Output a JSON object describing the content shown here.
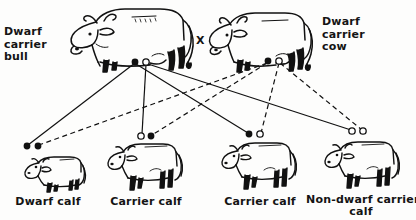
{
  "figure": {
    "ink_color": "#111111",
    "background_color": "#fdfdfc",
    "cross_symbol": "X"
  },
  "parents": [
    {
      "id": "bull",
      "label": "Dwarf\ncarrier\nbull",
      "label_lines": [
        "Dwarf",
        "carrier",
        "bull"
      ],
      "animal": "adult-bull",
      "gametes": [
        {
          "type": "filled",
          "allele": "dwarf",
          "x": 135,
          "y": 62
        },
        {
          "type": "open",
          "allele": "normal",
          "x": 146,
          "y": 62
        }
      ]
    },
    {
      "id": "cow",
      "label": "Dwarf\ncarrier\ncow",
      "label_lines": [
        "Dwarf",
        "carrier",
        "cow"
      ],
      "animal": "adult-cow",
      "gametes": [
        {
          "type": "filled",
          "allele": "dwarf",
          "x": 268,
          "y": 61
        },
        {
          "type": "open",
          "allele": "normal",
          "x": 279,
          "y": 61
        }
      ]
    }
  ],
  "offspring": [
    {
      "id": "calf-1",
      "label": "Dwarf calf",
      "label_lines": [
        "Dwarf calf"
      ],
      "animal": "dwarf-calf",
      "genotype": [
        {
          "type": "filled",
          "allele": "dwarf",
          "x": 27,
          "y": 146
        },
        {
          "type": "filled",
          "allele": "dwarf",
          "x": 38,
          "y": 146
        }
      ]
    },
    {
      "id": "calf-2",
      "label": "Carrier calf",
      "label_lines": [
        "Carrier calf"
      ],
      "animal": "normal-calf",
      "genotype": [
        {
          "type": "open",
          "allele": "normal",
          "x": 141,
          "y": 136
        },
        {
          "type": "filled",
          "allele": "dwarf",
          "x": 151,
          "y": 136
        }
      ]
    },
    {
      "id": "calf-3",
      "label": "Carrier calf",
      "label_lines": [
        "Carrier calf"
      ],
      "animal": "normal-calf",
      "genotype": [
        {
          "type": "filled",
          "allele": "dwarf",
          "x": 249,
          "y": 134
        },
        {
          "type": "open",
          "allele": "normal",
          "x": 260,
          "y": 134
        }
      ]
    },
    {
      "id": "calf-4",
      "label": "Non-dwarf carrier\ncalf",
      "label_lines": [
        "Non-dwarf  carrier",
        "calf"
      ],
      "animal": "normal-calf",
      "genotype": [
        {
          "type": "open",
          "allele": "normal",
          "x": 352,
          "y": 131
        },
        {
          "type": "open",
          "allele": "normal",
          "x": 363,
          "y": 131
        }
      ]
    }
  ],
  "inheritance_lines": [
    {
      "from": "bull-filled",
      "to": "calf-1-left",
      "style": "solid"
    },
    {
      "from": "bull-filled",
      "to": "calf-3-left",
      "style": "solid"
    },
    {
      "from": "bull-open",
      "to": "calf-2-left",
      "style": "solid"
    },
    {
      "from": "bull-open",
      "to": "calf-4-left",
      "style": "solid"
    },
    {
      "from": "cow-filled",
      "to": "calf-1-right",
      "style": "dashed"
    },
    {
      "from": "cow-filled",
      "to": "calf-2-right",
      "style": "dashed"
    },
    {
      "from": "cow-open",
      "to": "calf-3-right",
      "style": "dashed"
    },
    {
      "from": "cow-open",
      "to": "calf-4-right",
      "style": "dashed"
    }
  ]
}
